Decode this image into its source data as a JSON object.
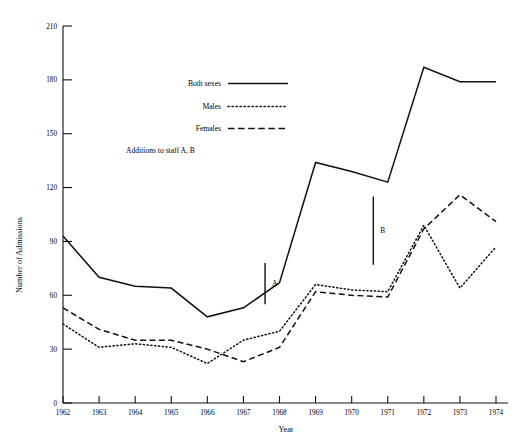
{
  "chart_data": {
    "type": "line",
    "title": "",
    "xlabel": "Year",
    "ylabel": "Number of Admissions",
    "x": [
      1962,
      1963,
      1964,
      1965,
      1966,
      1967,
      1968,
      1969,
      1970,
      1971,
      1972,
      1973,
      1974
    ],
    "xticklabels": [
      "1962",
      "1963",
      "1964",
      "1965",
      "1966",
      "1967",
      "1968",
      "1969",
      "1970",
      "1971",
      "1972",
      "1973",
      "1974"
    ],
    "yticks": [
      0,
      30,
      60,
      90,
      120,
      150,
      180,
      210
    ],
    "yticklabels": [
      "0",
      "30",
      "60",
      "90",
      "120",
      "150",
      "180",
      "210"
    ],
    "ylim": [
      0,
      210
    ],
    "xlim": [
      1962,
      1974
    ],
    "grid": false,
    "legend_position": "upper-center",
    "series": [
      {
        "name": "Both sexes",
        "style": "solid",
        "values": [
          93,
          70,
          65,
          64,
          48,
          53,
          67,
          134,
          129,
          123,
          187,
          179,
          179
        ]
      },
      {
        "name": "Males",
        "style": "dotted",
        "values": [
          44,
          31,
          33,
          31,
          22,
          35,
          40,
          66,
          63,
          62,
          99,
          64,
          87
        ]
      },
      {
        "name": "Females",
        "style": "dashed",
        "values": [
          53,
          41,
          35,
          35,
          30,
          23,
          31,
          62,
          60,
          59,
          97,
          116,
          101
        ]
      }
    ],
    "annotations": [
      {
        "label": "A",
        "x": 1967.6,
        "y_top": 78,
        "y_bottom": 55,
        "note": "Addition to staff A"
      },
      {
        "label": "B",
        "x": 1970.6,
        "y_top": 115,
        "y_bottom": 77,
        "note": "Addition to staff B"
      }
    ],
    "legend_entries": [
      {
        "label": "Both sexes",
        "style": "solid"
      },
      {
        "label": "Males",
        "style": "dotted"
      },
      {
        "label": "Females",
        "style": "dashed"
      }
    ],
    "legend_note": "Additions to staff  A, B"
  }
}
